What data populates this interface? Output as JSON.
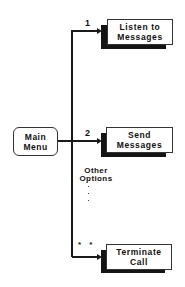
{
  "diagram": {
    "type": "menu-tree",
    "root": {
      "label_line1": "Main",
      "label_line2": "Menu"
    },
    "options": [
      {
        "key": "1",
        "label_line1": "Listen to",
        "label_line2": "Messages"
      },
      {
        "key": "2",
        "label_line1": "Send",
        "label_line2": "Messages"
      },
      {
        "key": "* *",
        "label_line1": "Terminate",
        "label_line2": "Call"
      }
    ],
    "other_options": {
      "label_line1": "Other",
      "label_line2": "Options",
      "ellipsis": "⋮"
    }
  },
  "colors": {
    "line": "#1a1a1a",
    "shadow": "#141414",
    "box_fill": "#ffffff",
    "background": "#ffffff"
  }
}
